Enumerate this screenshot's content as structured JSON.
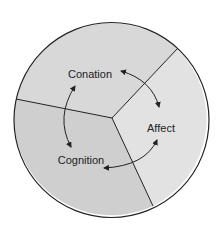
{
  "diagram": {
    "type": "three-part-circle",
    "segments": [
      {
        "id": "conation",
        "label": "Conation",
        "fill": "#d8d8d8"
      },
      {
        "id": "affect",
        "label": "Affect",
        "fill": "#e2e2e2"
      },
      {
        "id": "cognition",
        "label": "Cognition",
        "fill": "#cfcfcf"
      }
    ],
    "relationships": [
      {
        "from": "Conation",
        "to": "Affect",
        "direction": "bidirectional"
      },
      {
        "from": "Affect",
        "to": "Cognition",
        "direction": "bidirectional"
      },
      {
        "from": "Cognition",
        "to": "Conation",
        "direction": "bidirectional"
      }
    ],
    "colors": {
      "outline": "#222222",
      "text": "#222222",
      "background": "#ffffff"
    }
  }
}
